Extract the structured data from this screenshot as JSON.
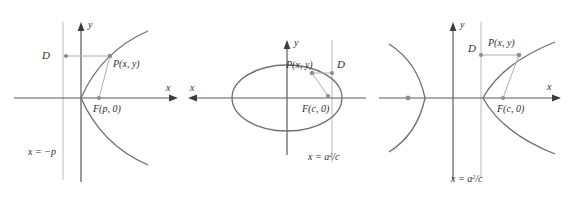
{
  "figure": {
    "colors": {
      "curve": "#6b6b6b",
      "axis": "#4a4a4a",
      "directrix": "#b9b9b9",
      "connector": "#b0b0b0",
      "point": "#8e8e8e",
      "label": "#2e2e2e",
      "background": "#ffffff"
    },
    "panels": [
      {
        "id": "parabola",
        "conic": "parabola",
        "axis_x_label": "x",
        "axis_y_label": "y",
        "directrix_label": "x = −p",
        "point_d_label": "D",
        "point_p_label": "P(x, y)",
        "focus_label": "F(p, 0)"
      },
      {
        "id": "ellipse",
        "conic": "ellipse",
        "axis_x_label": "x",
        "axis_y_label": "y",
        "directrix_label_prefix": "x = a",
        "directrix_label_exponent": "2",
        "directrix_label_suffix": "/c",
        "point_d_label": "D",
        "point_p_label": "P(x, y)",
        "focus_label": "F(c, 0)"
      },
      {
        "id": "hyperbola",
        "conic": "hyperbola",
        "axis_x_label": "x",
        "axis_y_label": "y",
        "directrix_label_prefix": "x = a",
        "directrix_label_exponent": "2",
        "directrix_label_suffix": "/c",
        "point_d_label": "D",
        "point_p_label": "P(x, y)",
        "focus_label": "F(c, 0)"
      }
    ]
  }
}
